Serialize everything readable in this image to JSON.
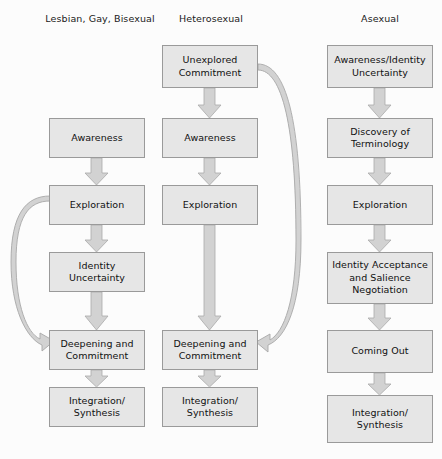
{
  "figure": {
    "type": "flowchart",
    "title": "",
    "background_color": "#fcfcfc",
    "node_fill_color": "#e6e6e6",
    "node_border_color": "#9a9a9a",
    "arrow_fill_color": "#d2d2d2",
    "arrow_border_color": "#a8a8a8"
  },
  "columns": [
    {
      "header": "Lesbian, Gay, Bisexual",
      "header_x": 100,
      "header_y": 13,
      "nodes": [
        {
          "label": "Awareness",
          "lines": [
            "Awareness"
          ],
          "x": 49,
          "y": 118,
          "w": 96,
          "h": 40
        },
        {
          "label": "Exploration",
          "lines": [
            "Exploration"
          ],
          "x": 49,
          "y": 185,
          "w": 96,
          "h": 40
        },
        {
          "label": "Identity Uncertainty",
          "lines": [
            "Identity",
            "Uncertainty"
          ],
          "x": 49,
          "y": 252,
          "w": 96,
          "h": 40
        },
        {
          "label": "Deepening and Commitment",
          "lines": [
            "Deepening and",
            "Commitment"
          ],
          "x": 49,
          "y": 330,
          "w": 96,
          "h": 40
        },
        {
          "label": "Integration/Synthesis",
          "lines": [
            "Integration/",
            "Synthesis"
          ],
          "x": 49,
          "y": 387,
          "w": 96,
          "h": 40
        }
      ]
    },
    {
      "header": "Heterosexual",
      "header_x": 211,
      "header_y": 13,
      "nodes": [
        {
          "label": "Unexplored Commitment",
          "lines": [
            "Unexplored",
            "Commitment"
          ],
          "x": 162,
          "y": 45,
          "w": 96,
          "h": 43
        },
        {
          "label": "Awareness",
          "lines": [
            "Awareness"
          ],
          "x": 162,
          "y": 118,
          "w": 96,
          "h": 40
        },
        {
          "label": "Exploration",
          "lines": [
            "Exploration"
          ],
          "x": 162,
          "y": 185,
          "w": 96,
          "h": 40
        },
        {
          "label": "Deepening and Commitment",
          "lines": [
            "Deepening and",
            "Commitment"
          ],
          "x": 162,
          "y": 330,
          "w": 96,
          "h": 40
        },
        {
          "label": "Integration/Synthesis",
          "lines": [
            "Integration/",
            "Synthesis"
          ],
          "x": 162,
          "y": 387,
          "w": 96,
          "h": 40
        }
      ]
    },
    {
      "header": "Asexual",
      "header_x": 380,
      "header_y": 13,
      "nodes": [
        {
          "label": "Awareness/Identity Uncertainty",
          "lines": [
            "Awareness/Identity",
            "Uncertainty"
          ],
          "x": 327,
          "y": 45,
          "w": 106,
          "h": 43
        },
        {
          "label": "Discovery of Terminology",
          "lines": [
            "Discovery of",
            "Terminology"
          ],
          "x": 327,
          "y": 118,
          "w": 106,
          "h": 40
        },
        {
          "label": "Exploration",
          "lines": [
            "Exploration"
          ],
          "x": 327,
          "y": 185,
          "w": 106,
          "h": 40
        },
        {
          "label": "Identity Acceptance and Salience Negotiation",
          "lines": [
            "Identity Acceptance",
            "and Salience",
            "Negotiation"
          ],
          "x": 327,
          "y": 252,
          "w": 106,
          "h": 52
        },
        {
          "label": "Coming Out",
          "lines": [
            "Coming Out"
          ],
          "x": 327,
          "y": 330,
          "w": 106,
          "h": 43
        },
        {
          "label": "Integration/Synthesis",
          "lines": [
            "Integration/",
            "Synthesis"
          ],
          "x": 327,
          "y": 395,
          "w": 106,
          "h": 48
        }
      ]
    }
  ],
  "edges": [
    {
      "from": "Unexplored Commitment",
      "to": "Awareness (Heterosexual)",
      "kind": "straight-down"
    },
    {
      "from": "Awareness (LGB)",
      "to": "Exploration (LGB)",
      "kind": "straight-down"
    },
    {
      "from": "Exploration (LGB)",
      "to": "Identity Uncertainty",
      "kind": "straight-down"
    },
    {
      "from": "Identity Uncertainty",
      "to": "Deepening and Commitment (LGB)",
      "kind": "straight-down"
    },
    {
      "from": "Deepening and Commitment (LGB)",
      "to": "Integration/Synthesis (LGB)",
      "kind": "straight-down"
    },
    {
      "from": "Exploration (LGB)",
      "to": "Deepening and Commitment (LGB)",
      "kind": "curve-left-bypass"
    },
    {
      "from": "Awareness (Heterosexual)",
      "to": "Exploration (Heterosexual)",
      "kind": "straight-down"
    },
    {
      "from": "Exploration (Heterosexual)",
      "to": "Deepening and Commitment (Heterosexual)",
      "kind": "straight-down-long"
    },
    {
      "from": "Deepening and Commitment (Heterosexual)",
      "to": "Integration/Synthesis (Heterosexual)",
      "kind": "straight-down"
    },
    {
      "from": "Unexplored Commitment",
      "to": "Deepening and Commitment (Heterosexual)",
      "kind": "curve-right-bypass"
    },
    {
      "from": "Awareness/Identity Uncertainty",
      "to": "Discovery of Terminology",
      "kind": "straight-down"
    },
    {
      "from": "Discovery of Terminology",
      "to": "Exploration (Asexual)",
      "kind": "straight-down"
    },
    {
      "from": "Exploration (Asexual)",
      "to": "Identity Acceptance and Salience Negotiation",
      "kind": "straight-down"
    },
    {
      "from": "Identity Acceptance and Salience Negotiation",
      "to": "Coming Out",
      "kind": "straight-down"
    },
    {
      "from": "Coming Out",
      "to": "Integration/Synthesis (Asexual)",
      "kind": "straight-down"
    }
  ]
}
